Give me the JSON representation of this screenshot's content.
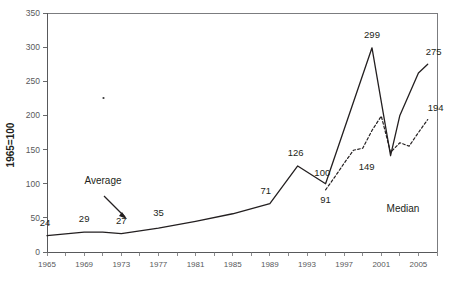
{
  "chart_data": {
    "type": "line",
    "title": "",
    "xlabel": "",
    "ylabel": "1965=100",
    "xlim": [
      1965,
      2007
    ],
    "ylim": [
      0,
      350
    ],
    "grid": false,
    "legend_position": "inline-annotations",
    "yticks": [
      0,
      50,
      100,
      150,
      200,
      250,
      300,
      350
    ],
    "ytick_labels": [
      "0",
      "50",
      "100",
      "150",
      "200",
      "250",
      "300",
      "350"
    ],
    "xticks": [
      1965,
      1967,
      1969,
      1971,
      1973,
      1975,
      1977,
      1979,
      1981,
      1983,
      1985,
      1987,
      1989,
      1991,
      1993,
      1995,
      1997,
      1999,
      2001,
      2003,
      2005,
      2007
    ],
    "xtick_labels": [
      "1965",
      "1969",
      "1973",
      "1977",
      "1981",
      "1985",
      "1989",
      "1993",
      "1997",
      "2001",
      "2005"
    ],
    "xtick_label_years": [
      1965,
      1969,
      1973,
      1977,
      1981,
      1985,
      1989,
      1993,
      1997,
      2001,
      2005
    ],
    "series": [
      {
        "name": "Average",
        "style": "solid",
        "color": "#231f20",
        "x": [
          1965,
          1969,
          1971,
          1973,
          1977,
          1981,
          1985,
          1989,
          1992,
          1995,
          2000,
          2002,
          2003,
          2005,
          2006
        ],
        "values": [
          24,
          29,
          29,
          27,
          35,
          45,
          56,
          71,
          126,
          100,
          299,
          141,
          200,
          262,
          275
        ]
      },
      {
        "name": "Median",
        "style": "dashed",
        "color": "#231f20",
        "x": [
          1995,
          1996,
          1997,
          1998,
          1999,
          2000,
          2001,
          2002,
          2003,
          2004,
          2005,
          2006
        ],
        "values": [
          91,
          110,
          130,
          149,
          152,
          178,
          199,
          146,
          160,
          155,
          175,
          194
        ]
      }
    ],
    "point_labels": [
      {
        "text": "24",
        "year": 1965,
        "value": 24
      },
      {
        "text": "29",
        "year": 1969,
        "value": 29
      },
      {
        "text": "27",
        "year": 1973,
        "value": 27
      },
      {
        "text": "35",
        "year": 1977,
        "value": 35
      },
      {
        "text": "71",
        "year": 1989,
        "value": 71
      },
      {
        "text": "126",
        "year": 1992,
        "value": 126
      },
      {
        "text": "100",
        "year": 1994,
        "value": 100
      },
      {
        "text": "91",
        "year": 1995,
        "value": 91
      },
      {
        "text": "299",
        "year": 2000,
        "value": 299
      },
      {
        "text": "149",
        "year": 1999,
        "value": 149
      },
      {
        "text": "275",
        "year": 2006,
        "value": 275
      },
      {
        "text": "194",
        "year": 2006,
        "value": 194
      }
    ],
    "annotations": [
      {
        "text": "Average",
        "type": "arrow-label"
      },
      {
        "text": "Median",
        "type": "label"
      }
    ]
  },
  "axis": {
    "y_title": "1965=100"
  },
  "annotations": {
    "average_label": "Average",
    "median_label": "Median"
  }
}
